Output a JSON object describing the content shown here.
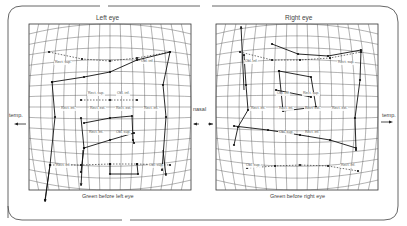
{
  "figure": {
    "left_panel": {
      "title": "Left eye",
      "caption": "Green before left eye",
      "labels": [
        "Rect. sup.",
        "Obl. inf.",
        "Rect. sup.",
        "Obl. inf.",
        "Rect. int.",
        "Rect. ext.",
        "Rect. ext.",
        "Rect. int.",
        "Rect. int.",
        "Obl. sup.",
        "Rect. inf.",
        "Obl. sup."
      ]
    },
    "right_panel": {
      "title": "Right eye",
      "caption": "Green before right eye",
      "labels": [
        "Obl. inf.",
        "Rect. sup.",
        "Obl. inf.",
        "Rect. sup.",
        "Rect. int.",
        "Rect. int.",
        "Rect. ext.",
        "Rect. ext.",
        "Obl. sup.",
        "Rect. inf.",
        "Obl. sup.",
        "Rect. inf."
      ]
    },
    "side_labels": {
      "left_temp": "temp.",
      "center_nasal": "nasal",
      "right_temp": "temp."
    }
  }
}
